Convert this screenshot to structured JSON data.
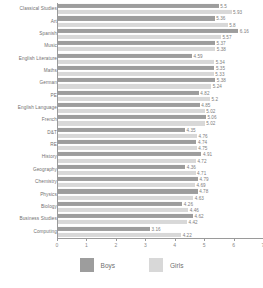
{
  "chart_data": {
    "type": "bar",
    "orientation": "horizontal",
    "title": "",
    "xlabel": "",
    "ylabel": "",
    "xlim": [
      0,
      7
    ],
    "xticks": [
      "0",
      "1",
      "2",
      "3",
      "4",
      "5",
      "6",
      "7"
    ],
    "grid": false,
    "legend_position": "bottom",
    "categories": [
      "Classical Studies",
      "Art",
      "Spanish",
      "Music",
      "English Literature",
      "Maths",
      "German",
      "PE",
      "English Language",
      "French",
      "D&T",
      "RE",
      "History",
      "Geography",
      "Chemistry",
      "Physics",
      "Biology",
      "Business Studies",
      "Computing"
    ],
    "series": [
      {
        "name": "Boys",
        "color": "#9d9d9d",
        "values": [
          5.5,
          5.36,
          6.16,
          5.37,
          4.59,
          5.35,
          5.38,
          4.82,
          4.85,
          5.06,
          4.35,
          4.74,
          4.91,
          4.36,
          4.79,
          4.78,
          4.26,
          4.62,
          3.16
        ],
        "labels": [
          "5.5",
          "5.36",
          "6.16",
          "5.37",
          "4.59",
          "5.35",
          "5.38",
          "4.82",
          "4.85",
          "5.06",
          "4.35",
          "4.74",
          "4.91",
          "4.36",
          "4.79",
          "4.78",
          "4.26",
          "4.62",
          "3.16"
        ]
      },
      {
        "name": "Girls",
        "color": "#d8d8d8",
        "values": [
          5.93,
          5.8,
          5.57,
          5.38,
          5.34,
          5.33,
          5.24,
          5.2,
          5.02,
          5.02,
          4.76,
          4.75,
          4.72,
          4.71,
          4.69,
          4.63,
          4.46,
          4.42,
          4.22
        ],
        "labels": [
          "5.93",
          "5.8",
          "5.57",
          "5.38",
          "5.34",
          "5.33",
          "5.24",
          "5.2",
          "5.02",
          "5.02",
          "4.76",
          "4.75",
          "4.72",
          "4.71",
          "4.69",
          "4.63",
          "4.46",
          "4.42",
          "4.22"
        ]
      }
    ]
  },
  "legend": {
    "items": [
      {
        "label": "Boys",
        "color": "#9d9d9d"
      },
      {
        "label": "Girls",
        "color": "#d8d8d8"
      }
    ]
  }
}
